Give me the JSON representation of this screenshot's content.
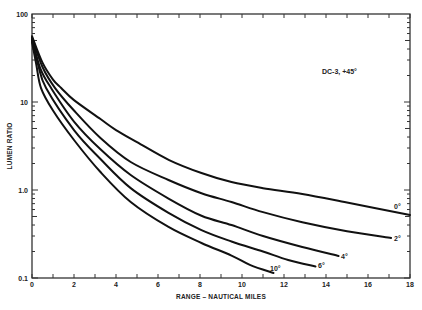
{
  "chart_data": {
    "type": "line",
    "title": "",
    "annotation": "DC-3, +45°",
    "xlabel": "RANGE  –  NAUTICAL MILES",
    "ylabel": "LUMEN RATIO",
    "xlim": [
      0,
      18
    ],
    "ylim": [
      0.1,
      100
    ],
    "yscale": "log",
    "grid": false,
    "legend": "inline labels at curve ends",
    "x_ticks": [
      0,
      2,
      4,
      6,
      8,
      10,
      12,
      14,
      16,
      18
    ],
    "x_tick_labels": [
      "0",
      "2",
      "4",
      "6",
      "8",
      "10",
      "12",
      "14",
      "16",
      "18"
    ],
    "x_minor_step": 1,
    "y_ticks": [
      100,
      10,
      1,
      0.1
    ],
    "y_tick_labels": [
      "100",
      "10",
      "1.0",
      "0.1"
    ],
    "series": [
      {
        "name": "0°",
        "points": [
          [
            0,
            56
          ],
          [
            0.5,
            28
          ],
          [
            1,
            18
          ],
          [
            1.39,
            14.4
          ],
          [
            2,
            10.5
          ],
          [
            3.26,
            6.4
          ],
          [
            4,
            4.8
          ],
          [
            5,
            3.5
          ],
          [
            6.53,
            2.19
          ],
          [
            8.07,
            1.56
          ],
          [
            9.5,
            1.23
          ],
          [
            11,
            1.05
          ],
          [
            12.87,
            0.9
          ],
          [
            15,
            0.72
          ],
          [
            18,
            0.52
          ]
        ]
      },
      {
        "name": "2°",
        "points": [
          [
            0,
            54
          ],
          [
            0.5,
            25
          ],
          [
            1.1,
            14.4
          ],
          [
            2,
            8.0
          ],
          [
            3.26,
            3.9
          ],
          [
            4.7,
            2.08
          ],
          [
            6.5,
            1.3
          ],
          [
            8.07,
            0.92
          ],
          [
            9.5,
            0.73
          ],
          [
            11,
            0.56
          ],
          [
            12.87,
            0.43
          ],
          [
            15,
            0.34
          ],
          [
            17.1,
            0.285
          ]
        ]
      },
      {
        "name": "4°",
        "points": [
          [
            0,
            52
          ],
          [
            0.4,
            24
          ],
          [
            0.91,
            14.4
          ],
          [
            2,
            6.0
          ],
          [
            3.26,
            2.9
          ],
          [
            4.7,
            1.48
          ],
          [
            6.5,
            0.8
          ],
          [
            8.07,
            0.51
          ],
          [
            9.5,
            0.4
          ],
          [
            11,
            0.3
          ],
          [
            12.87,
            0.225
          ],
          [
            14.6,
            0.178
          ]
        ]
      },
      {
        "name": "6°",
        "points": [
          [
            0,
            50
          ],
          [
            0.3,
            26
          ],
          [
            0.67,
            14.4
          ],
          [
            2,
            4.8
          ],
          [
            3.26,
            2.25
          ],
          [
            4.7,
            1.05
          ],
          [
            6.5,
            0.55
          ],
          [
            8.07,
            0.35
          ],
          [
            9.5,
            0.26
          ],
          [
            11,
            0.2
          ],
          [
            12.2,
            0.16
          ],
          [
            13.5,
            0.135
          ]
        ]
      },
      {
        "name": "10°",
        "points": [
          [
            0,
            48
          ],
          [
            0.2,
            27
          ],
          [
            0.43,
            14.4
          ],
          [
            1,
            8
          ],
          [
            2,
            3.7
          ],
          [
            3.26,
            1.6
          ],
          [
            4.7,
            0.73
          ],
          [
            6.5,
            0.38
          ],
          [
            8.07,
            0.25
          ],
          [
            9.5,
            0.18
          ],
          [
            10.4,
            0.14
          ],
          [
            11.5,
            0.114
          ]
        ]
      }
    ]
  }
}
